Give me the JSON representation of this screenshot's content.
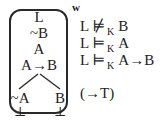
{
  "world": {
    "label": "w"
  },
  "tree": {
    "trunk": [
      {
        "text": "L"
      },
      {
        "text": "~B"
      },
      {
        "text": "A"
      },
      {
        "text": "A→B"
      }
    ],
    "left_branch": {
      "text": "~A",
      "closure": "⊥"
    },
    "right_branch": {
      "text": "B",
      "closure": "⊥"
    }
  },
  "statements": [
    {
      "lhs": "L",
      "symbol": "⊭",
      "subscript": "K",
      "rhs": "B"
    },
    {
      "lhs": "L",
      "symbol": "⊨",
      "subscript": "K",
      "rhs": "A"
    },
    {
      "lhs": "L",
      "symbol": "⊨",
      "subscript": "K",
      "rhs": "A→B"
    }
  ],
  "rule": {
    "label": "(→T)"
  },
  "colors": {
    "ink": "#222222",
    "border": "#2a2a2a",
    "background": "#ffffff"
  }
}
